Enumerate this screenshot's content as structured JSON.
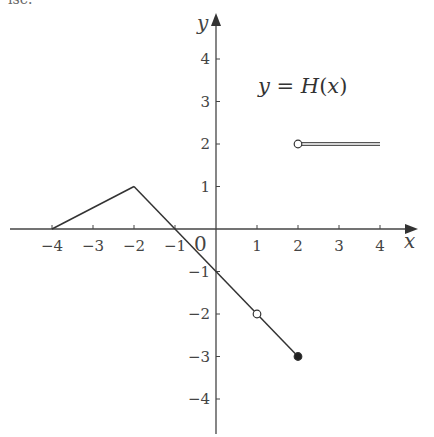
{
  "header_fragment": "ise.",
  "chart_data": {
    "type": "line",
    "title": "y = H(x)",
    "xlabel": "x",
    "ylabel": "y",
    "xlim": [
      -4.5,
      4.7
    ],
    "ylim": [
      -4.8,
      4.6
    ],
    "grid": false,
    "x_ticks": [
      -4,
      -3,
      -2,
      -1,
      1,
      2,
      3,
      4
    ],
    "y_ticks": [
      4,
      3,
      2,
      1,
      -1,
      -2,
      -3,
      -4
    ],
    "origin_label": "0",
    "segments": [
      {
        "name": "segment-1",
        "points": [
          [
            -4,
            0
          ],
          [
            -2,
            1
          ]
        ],
        "start": "closed",
        "end": "closed"
      },
      {
        "name": "segment-2",
        "points": [
          [
            -2,
            1
          ],
          [
            1,
            -2
          ]
        ],
        "start": "closed",
        "end": "open"
      },
      {
        "name": "segment-3",
        "points": [
          [
            1,
            -2
          ],
          [
            2,
            -3
          ]
        ],
        "start": "open",
        "end": "closed"
      },
      {
        "name": "segment-4",
        "points": [
          [
            2,
            2
          ],
          [
            4,
            2
          ]
        ],
        "start": "open",
        "end": "none",
        "style": "double-line"
      }
    ],
    "markers": [
      {
        "x": 1,
        "y": -2,
        "type": "open"
      },
      {
        "x": 2,
        "y": -3,
        "type": "filled"
      },
      {
        "x": 2,
        "y": 2,
        "type": "open"
      }
    ]
  }
}
